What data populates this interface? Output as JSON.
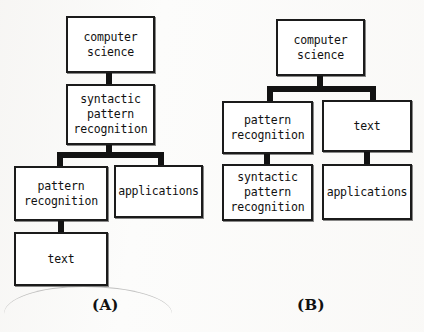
{
  "figure": {
    "type": "diagram",
    "background_color": "#fcfcfb",
    "node_fill": "#ffffff",
    "node_border_color": "#1b1b1b",
    "connector_color": "#121212"
  },
  "diagram_a": {
    "caption": "(A)",
    "nodes": [
      {
        "id": "a-cs",
        "label": "computer\nscience"
      },
      {
        "id": "a-spr",
        "label": "syntactic\npattern\nrecognition"
      },
      {
        "id": "a-pr",
        "label": "pattern\nrecognition"
      },
      {
        "id": "a-applications",
        "label": "applications"
      },
      {
        "id": "a-text",
        "label": "text"
      }
    ],
    "edges": [
      {
        "from": "a-cs",
        "to": "a-spr"
      },
      {
        "from": "a-spr",
        "to": "a-pr"
      },
      {
        "from": "a-spr",
        "to": "a-applications"
      },
      {
        "from": "a-pr",
        "to": "a-text"
      }
    ]
  },
  "diagram_b": {
    "caption": "(B)",
    "nodes": [
      {
        "id": "b-cs",
        "label": "computer\nscience"
      },
      {
        "id": "b-pr",
        "label": "pattern\nrecognition"
      },
      {
        "id": "b-text",
        "label": "text"
      },
      {
        "id": "b-spr",
        "label": "syntactic\npattern\nrecognition"
      },
      {
        "id": "b-applications",
        "label": "applications"
      }
    ],
    "edges": [
      {
        "from": "b-cs",
        "to": "b-pr"
      },
      {
        "from": "b-cs",
        "to": "b-text"
      },
      {
        "from": "b-pr",
        "to": "b-spr"
      },
      {
        "from": "b-text",
        "to": "b-applications"
      }
    ]
  }
}
